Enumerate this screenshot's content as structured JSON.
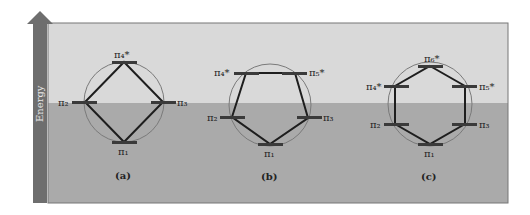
{
  "axis": {
    "label": "Energy",
    "direction": "up"
  },
  "colors": {
    "upper_band": "#d8d8d8",
    "lower_band": "#a9a9a9",
    "arrow": "#6e6e6e",
    "circle": "#7a7a7a",
    "polygon_edge": "#1e1e1e",
    "level_bar": "#3a3a3a"
  },
  "diagrams": [
    {
      "caption": "(a)",
      "shape": "square (cyclobutadiene, 4 MOs)",
      "levels": [
        {
          "label": "π₄*"
        },
        {
          "label": "π₂"
        },
        {
          "label": "π₃"
        },
        {
          "label": "π₁"
        }
      ]
    },
    {
      "caption": "(b)",
      "shape": "pentagon (5 MOs)",
      "levels": [
        {
          "label": "π₄*"
        },
        {
          "label": "π₅*"
        },
        {
          "label": "π₂"
        },
        {
          "label": "π₃"
        },
        {
          "label": "π₁"
        }
      ]
    },
    {
      "caption": "(c)",
      "shape": "hexagon (benzene, 6 MOs)",
      "levels": [
        {
          "label": "π₆*"
        },
        {
          "label": "π₄*"
        },
        {
          "label": "π₅*"
        },
        {
          "label": "π₂"
        },
        {
          "label": "π₃"
        },
        {
          "label": "π₁"
        }
      ]
    }
  ]
}
